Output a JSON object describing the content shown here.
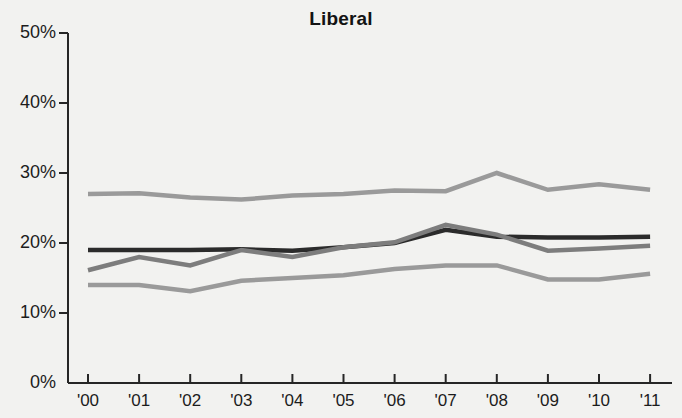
{
  "chart_data": {
    "type": "line",
    "title": "Liberal",
    "xlabel": "",
    "ylabel": "",
    "ylim": [
      0,
      50
    ],
    "yticks": [
      0,
      10,
      20,
      30,
      40,
      50
    ],
    "ytick_labels": [
      "0%",
      "10%",
      "20%",
      "30%",
      "40%",
      "50%"
    ],
    "x": [
      2000,
      2001,
      2002,
      2003,
      2004,
      2005,
      2006,
      2007,
      2008,
      2009,
      2010,
      2011
    ],
    "categories": [
      "'00",
      "'01",
      "'02",
      "'03",
      "'04",
      "'05",
      "'06",
      "'07",
      "'08",
      "'09",
      "'10",
      "'11"
    ],
    "grid": false,
    "legend": "none",
    "series": [
      {
        "name": "top-line",
        "color": "#9a9a9a",
        "width": 4.5,
        "values": [
          27.0,
          27.1,
          26.5,
          26.2,
          26.8,
          27.0,
          27.5,
          27.4,
          30.0,
          27.6,
          28.4,
          27.6
        ]
      },
      {
        "name": "dark-line",
        "color": "#2b2b2b",
        "width": 4.5,
        "values": [
          19.0,
          19.0,
          19.0,
          19.1,
          18.9,
          19.4,
          20.0,
          21.9,
          20.9,
          20.8,
          20.8,
          20.9
        ]
      },
      {
        "name": "mid-line",
        "color": "#7d7d7d",
        "width": 4.5,
        "values": [
          16.1,
          18.0,
          16.8,
          19.0,
          18.0,
          19.4,
          20.1,
          22.6,
          21.2,
          18.9,
          19.2,
          19.6
        ]
      },
      {
        "name": "bottom-line",
        "color": "#9a9a9a",
        "width": 4.5,
        "values": [
          14.0,
          14.0,
          13.1,
          14.6,
          15.0,
          15.4,
          16.3,
          16.8,
          16.8,
          14.8,
          14.8,
          15.6
        ]
      }
    ]
  },
  "axes": {
    "y_pixel_top": 33,
    "y_pixel_bottom": 383,
    "x_pixel_first": 88,
    "x_pixel_step": 51.1
  }
}
